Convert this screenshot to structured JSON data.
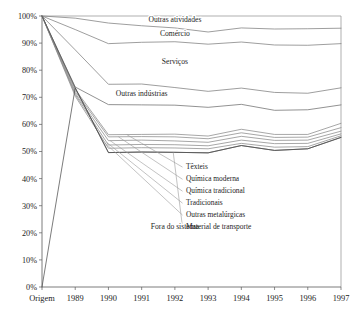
{
  "chart_data": {
    "type": "line",
    "title": "",
    "subtitle": "",
    "xlabel": "",
    "ylabel": "",
    "ylim": [
      0,
      100
    ],
    "grid": false,
    "legend_position": "inline-labels",
    "y_tick_labels": [
      "0%",
      "10%",
      "20%",
      "30%",
      "40%",
      "50%",
      "60%",
      "70%",
      "80%",
      "90%",
      "100%"
    ],
    "y_tick_values": [
      0,
      10,
      20,
      30,
      40,
      50,
      60,
      70,
      80,
      90,
      100
    ],
    "categories": [
      "Origem",
      "1989",
      "1990",
      "1991",
      "1992",
      "1993",
      "1994",
      "1995",
      "1996",
      "1997"
    ],
    "x": [
      "Origem",
      "1989",
      "1990",
      "1991",
      "1992",
      "1993",
      "1994",
      "1995",
      "1996",
      "1997"
    ],
    "series": [
      {
        "name": "Outras atividades",
        "label_kind": "inline",
        "color": "#7d7d7d",
        "values": [
          100.0,
          99.2,
          97.4,
          96.4,
          95.6,
          94.1,
          95.6,
          95.2,
          95.3,
          95.5
        ]
      },
      {
        "name": "Comércio",
        "label_kind": "inline",
        "color": "#7d7d7d",
        "values": [
          100.0,
          95.0,
          89.8,
          90.3,
          90.5,
          89.6,
          90.4,
          89.3,
          89.2,
          89.8
        ]
      },
      {
        "name": "Serviços",
        "label_kind": "inline",
        "color": "#7d7d7d",
        "values": [
          100.0,
          87.5,
          74.8,
          74.9,
          73.6,
          72.2,
          73.4,
          71.8,
          71.5,
          73.5
        ]
      },
      {
        "name": "Outras indústrias",
        "label_kind": "inline",
        "color": "#6e6e6e",
        "values": [
          100.0,
          73.8,
          67.3,
          67.2,
          67.1,
          66.3,
          67.4,
          65.2,
          65.4,
          67.2
        ]
      },
      {
        "name": "Têxteis",
        "label_kind": "callout",
        "color": "#8a8a8a",
        "values": [
          100.0,
          72.9,
          56.2,
          56.3,
          56.4,
          55.7,
          58.2,
          56.3,
          56.3,
          60.4
        ]
      },
      {
        "name": "Química moderna",
        "label_kind": "callout",
        "color": "#8a8a8a",
        "values": [
          100.0,
          72.2,
          55.4,
          55.5,
          55.4,
          54.7,
          56.9,
          55.2,
          55.3,
          58.8
        ]
      },
      {
        "name": "Química tradicional",
        "label_kind": "callout",
        "color": "#8a8a8a",
        "values": [
          100.0,
          71.5,
          54.0,
          54.2,
          53.9,
          53.4,
          55.6,
          54.1,
          54.2,
          57.5
        ]
      },
      {
        "name": "Tradicionais",
        "label_kind": "callout",
        "color": "#8a8a8a",
        "values": [
          100.0,
          71.0,
          52.4,
          52.6,
          52.5,
          52.1,
          54.2,
          52.9,
          53.0,
          56.5
        ]
      },
      {
        "name": "Outras metalúrgicas",
        "label_kind": "callout",
        "color": "#8a8a8a",
        "values": [
          100.0,
          70.4,
          51.2,
          51.4,
          51.3,
          51.0,
          53.0,
          51.6,
          51.8,
          55.8
        ]
      },
      {
        "name": "Material de transporte",
        "label_kind": "callout",
        "color": "#4f4f4f",
        "values": [
          100.0,
          73.5,
          49.6,
          49.8,
          49.7,
          49.5,
          52.2,
          50.4,
          51.0,
          55.2
        ]
      },
      {
        "name": "Fora do sistema",
        "label_kind": "area-label",
        "color": "#4f4f4f",
        "values": [
          0.0,
          73.5,
          49.6,
          49.8,
          49.7,
          49.5,
          52.2,
          50.4,
          51.0,
          55.2
        ]
      }
    ],
    "annotations": [
      {
        "text": "Outras atividades",
        "placement": "inline-on-band",
        "x_ref": "1992",
        "y_ref": 97.7
      },
      {
        "text": "Comércio",
        "placement": "inline-on-band",
        "x_ref": "1992",
        "y_ref": 92.6
      },
      {
        "text": "Serviços",
        "placement": "inline-on-band",
        "x_ref": "1992",
        "y_ref": 82.4
      },
      {
        "text": "Outras indústrias",
        "placement": "inline-on-band",
        "x_ref": "1991",
        "y_ref": 70.6
      },
      {
        "text": "Fora do sistema",
        "placement": "area-interior",
        "x_ref": "1992",
        "y_ref": 21.5
      },
      {
        "text": "Têxteis",
        "placement": "callout-right",
        "y_ref": 43.5
      },
      {
        "text": "Química moderna",
        "placement": "callout-right",
        "y_ref": 39.0
      },
      {
        "text": "Química tradicional",
        "placement": "callout-right",
        "y_ref": 34.6
      },
      {
        "text": "Tradicionais",
        "placement": "callout-right",
        "y_ref": 30.2
      },
      {
        "text": "Outras metalúrgicas",
        "placement": "callout-right",
        "y_ref": 25.8
      },
      {
        "text": "Material de transporte",
        "placement": "callout-right",
        "y_ref": 21.4
      }
    ]
  },
  "axes": {
    "y_ticks": [
      {
        "label": "100%"
      },
      {
        "label": "90%"
      },
      {
        "label": "80%"
      },
      {
        "label": "70%"
      },
      {
        "label": "60%"
      },
      {
        "label": "50%"
      },
      {
        "label": "40%"
      },
      {
        "label": "30%"
      },
      {
        "label": "20%"
      },
      {
        "label": "10%"
      },
      {
        "label": "0%"
      }
    ],
    "x_ticks": [
      {
        "label": "Origem"
      },
      {
        "label": "1989"
      },
      {
        "label": "1990"
      },
      {
        "label": "1991"
      },
      {
        "label": "1992"
      },
      {
        "label": "1993"
      },
      {
        "label": "1994"
      },
      {
        "label": "1995"
      },
      {
        "label": "1996"
      },
      {
        "label": "1997"
      }
    ]
  },
  "style": {
    "background": "#ffffff",
    "axis_color": "#5a5a5a",
    "frame_color": "#8e8e8e",
    "text_color": "#1d1d1d",
    "line_color_light": "#8a8a8a",
    "line_color_dark": "#4f4f4f"
  }
}
